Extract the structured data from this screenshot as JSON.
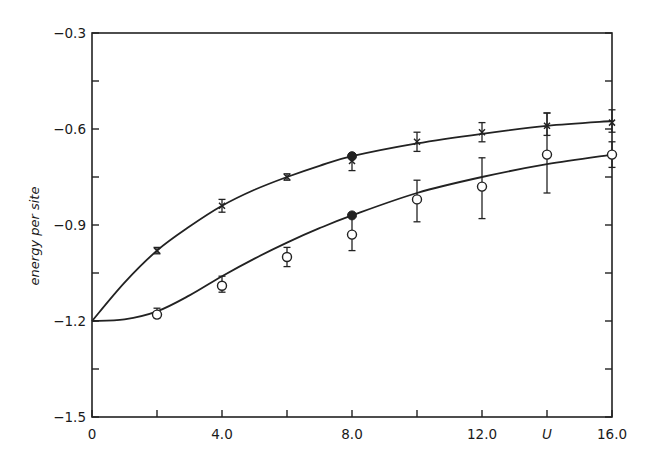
{
  "chart_data": {
    "type": "line",
    "title": "",
    "xlabel": "U",
    "ylabel": "energy per site",
    "xlim": [
      0,
      16
    ],
    "ylim": [
      -1.5,
      -0.3
    ],
    "grid": false,
    "legend": null,
    "x_ticks": [
      0,
      2,
      4,
      6,
      8,
      10,
      12,
      14,
      16
    ],
    "x_tick_labels": [
      {
        "value": 0,
        "label": "0"
      },
      {
        "value": 4,
        "label": "4.0"
      },
      {
        "value": 8,
        "label": "8.0"
      },
      {
        "value": 12,
        "label": "12.0"
      },
      {
        "value": 14,
        "label": "U"
      },
      {
        "value": 16,
        "label": "16.0"
      }
    ],
    "y_ticks": [
      -1.5,
      -1.35,
      -1.2,
      -1.05,
      -0.9,
      -0.75,
      -0.6,
      -0.45,
      -0.3
    ],
    "y_tick_labels": [
      {
        "value": -0.3,
        "label": "-0.3"
      },
      {
        "value": -0.6,
        "label": "-0.6"
      },
      {
        "value": -0.9,
        "label": "-0.9"
      },
      {
        "value": -1.2,
        "label": "-1.2"
      },
      {
        "value": -1.5,
        "label": "-1.5"
      }
    ],
    "series": [
      {
        "name": "upper data (crosses)",
        "marker": "cross",
        "x": [
          2,
          4,
          6,
          8,
          10,
          12,
          14,
          16
        ],
        "values": [
          -0.98,
          -0.84,
          -0.75,
          -0.7,
          -0.64,
          -0.61,
          -0.59,
          -0.58
        ],
        "err_low": [
          -0.99,
          -0.86,
          -0.76,
          -0.73,
          -0.67,
          -0.64,
          -0.62,
          -0.61
        ],
        "err_high": [
          -0.97,
          -0.82,
          -0.74,
          -0.68,
          -0.61,
          -0.58,
          -0.55,
          -0.54
        ]
      },
      {
        "name": "lower data (open circles)",
        "marker": "open-circle",
        "x": [
          2,
          4,
          6,
          8,
          10,
          12,
          14,
          16
        ],
        "values": [
          -1.18,
          -1.09,
          -1.0,
          -0.93,
          -0.82,
          -0.78,
          -0.68,
          -0.68
        ],
        "err_low": [
          -1.19,
          -1.11,
          -1.03,
          -0.98,
          -0.89,
          -0.88,
          -0.8,
          -0.72
        ],
        "err_high": [
          -1.16,
          -1.06,
          -0.97,
          -0.87,
          -0.76,
          -0.69,
          -0.55,
          -0.64
        ]
      },
      {
        "name": "exact points (filled circles)",
        "marker": "filled-circle",
        "x": [
          8,
          8
        ],
        "values": [
          -0.685,
          -0.87
        ]
      },
      {
        "name": "upper curve",
        "marker": "none",
        "x": [
          0,
          1,
          2,
          3,
          4,
          5,
          6,
          7,
          8,
          10,
          12,
          14,
          16
        ],
        "values": [
          -1.2,
          -1.08,
          -0.98,
          -0.905,
          -0.84,
          -0.79,
          -0.75,
          -0.715,
          -0.685,
          -0.645,
          -0.615,
          -0.59,
          -0.575
        ]
      },
      {
        "name": "lower curve",
        "marker": "none",
        "x": [
          0,
          1,
          2,
          3,
          4,
          5,
          6,
          7,
          8,
          10,
          12,
          14,
          16
        ],
        "values": [
          -1.2,
          -1.195,
          -1.17,
          -1.12,
          -1.06,
          -1.005,
          -0.955,
          -0.91,
          -0.87,
          -0.8,
          -0.75,
          -0.71,
          -0.68
        ]
      }
    ]
  },
  "style": {
    "ink": "#222222",
    "background": "#ffffff"
  },
  "plot_box": {
    "left": 92,
    "right": 612,
    "top": 33,
    "bottom": 417
  }
}
